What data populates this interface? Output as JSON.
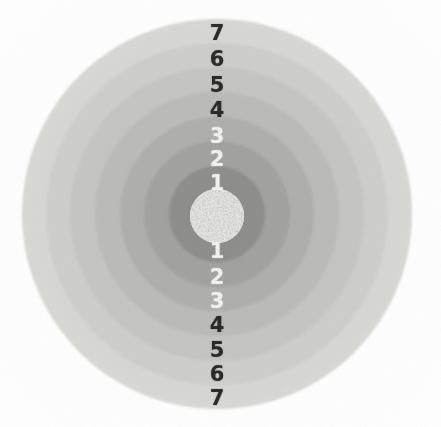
{
  "figure": {
    "name": "concentric-zone-target",
    "background_color": "#ffffff",
    "canvas": {
      "width": 441,
      "height": 427
    },
    "center": {
      "x": 217,
      "y": 214
    }
  },
  "chart_data": {
    "type": "pie",
    "title": "",
    "subtitle": "",
    "xlabel": "",
    "ylabel": "",
    "legend_position": "none",
    "grid": false,
    "categories": [
      "core",
      "1",
      "2",
      "3",
      "4",
      "5",
      "6",
      "7"
    ],
    "values": [
      27,
      48,
      73,
      97,
      122,
      147,
      171,
      195
    ],
    "value_label": "outer radius (px)",
    "series": [
      {
        "name": "ring fill gray level",
        "values": [
          "#dcdcd8",
          "#8f8f8c",
          "#a3a3a0",
          "#b0b0ad",
          "#bcbcb9",
          "#c6c6c3",
          "#cfcfcc",
          "#d8d8d5"
        ]
      }
    ],
    "rings": [
      {
        "index": 7,
        "label": "7",
        "outer_radius": 195,
        "fill": "#d8d8d5"
      },
      {
        "index": 6,
        "label": "6",
        "outer_radius": 171,
        "fill": "#cfcfcc"
      },
      {
        "index": 5,
        "label": "5",
        "outer_radius": 147,
        "fill": "#c6c6c3"
      },
      {
        "index": 4,
        "label": "4",
        "outer_radius": 122,
        "fill": "#bcbcb9"
      },
      {
        "index": 3,
        "label": "3",
        "outer_radius": 97,
        "fill": "#b0b0ad"
      },
      {
        "index": 2,
        "label": "2",
        "outer_radius": 73,
        "fill": "#a3a3a0"
      },
      {
        "index": 1,
        "label": "1",
        "outer_radius": 48,
        "fill": "#8f8f8c"
      },
      {
        "index": 0,
        "label": "core",
        "outer_radius": 27,
        "fill": "#dcdcd8"
      }
    ]
  },
  "scale": {
    "orientation": "vertical",
    "upper_labels": [
      {
        "text": "7",
        "y": 33,
        "color": "dark"
      },
      {
        "text": "6",
        "y": 59,
        "color": "dark"
      },
      {
        "text": "5",
        "y": 85,
        "color": "dark"
      },
      {
        "text": "4",
        "y": 110,
        "color": "dark"
      },
      {
        "text": "3",
        "y": 136,
        "color": "light"
      },
      {
        "text": "2",
        "y": 159,
        "color": "light"
      },
      {
        "text": "1",
        "y": 183,
        "color": "light"
      }
    ],
    "lower_labels": [
      {
        "text": "1",
        "y": 251,
        "color": "light"
      },
      {
        "text": "2",
        "y": 277,
        "color": "light"
      },
      {
        "text": "3",
        "y": 301,
        "color": "light"
      },
      {
        "text": "4",
        "y": 325,
        "color": "dark"
      },
      {
        "text": "5",
        "y": 350,
        "color": "dark"
      },
      {
        "text": "6",
        "y": 374,
        "color": "dark"
      },
      {
        "text": "7",
        "y": 398,
        "color": "dark"
      }
    ],
    "label_x": 217,
    "dark_color": "#2b2b2b",
    "light_color": "#f2f2f0"
  }
}
